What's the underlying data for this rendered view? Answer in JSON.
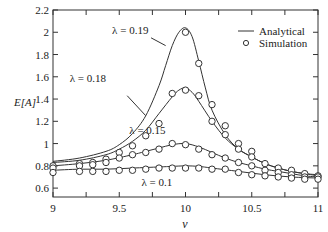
{
  "chart_data": {
    "type": "line",
    "title": "",
    "xlabel": "v",
    "ylabel": "E[A]",
    "xlim": [
      9,
      11
    ],
    "ylim": [
      0.52,
      2.2
    ],
    "xticks": [
      9,
      9.5,
      10,
      10.5,
      11
    ],
    "xtick_labels": [
      "9",
      "9.5",
      "10",
      "10.5",
      "11"
    ],
    "yticks": [
      0.6,
      0.8,
      1,
      1.2,
      1.4,
      1.6,
      1.8,
      2,
      2.2
    ],
    "ytick_labels": [
      "0.6",
      "0.8",
      "1",
      "1.2",
      "1.4",
      "1.6",
      "1.8",
      "2",
      "2.2"
    ],
    "grid": false,
    "legend": {
      "position": "upper right",
      "entries": [
        {
          "label": "Analytical",
          "marker": "line"
        },
        {
          "label": "Simulation",
          "marker": "circle"
        }
      ]
    },
    "series": [
      {
        "name": "λ = 0.19",
        "label_pos": [
          9.72,
          1.98
        ],
        "analytical": {
          "x": [
            9,
            9.2,
            9.4,
            9.5,
            9.6,
            9.7,
            9.8,
            9.85,
            9.9,
            9.95,
            10,
            10.05,
            10.1,
            10.15,
            10.2,
            10.3,
            10.4,
            10.5,
            10.6,
            10.7,
            10.8,
            10.9,
            11
          ],
          "y": [
            0.84,
            0.87,
            0.93,
            0.99,
            1.09,
            1.25,
            1.52,
            1.7,
            1.88,
            2.0,
            2.04,
            1.96,
            1.74,
            1.5,
            1.3,
            1.08,
            0.95,
            0.88,
            0.82,
            0.78,
            0.75,
            0.73,
            0.72
          ]
        },
        "simulation": {
          "x": [
            10.0,
            10.1,
            10.2,
            10.3,
            10.4,
            10.5
          ],
          "y": [
            2.0,
            1.72,
            1.35,
            1.16,
            1.0,
            0.93
          ]
        }
      },
      {
        "name": "λ = 0.18",
        "label_pos": [
          9.4,
          1.55
        ],
        "analytical": {
          "x": [
            9,
            9.2,
            9.4,
            9.5,
            9.6,
            9.7,
            9.8,
            9.9,
            9.95,
            10,
            10.05,
            10.1,
            10.2,
            10.3,
            10.4,
            10.5,
            10.6,
            10.7,
            10.8,
            10.9,
            11
          ],
          "y": [
            0.83,
            0.85,
            0.9,
            0.95,
            1.02,
            1.12,
            1.27,
            1.42,
            1.48,
            1.5,
            1.46,
            1.38,
            1.2,
            1.05,
            0.95,
            0.88,
            0.82,
            0.78,
            0.75,
            0.73,
            0.71
          ]
        },
        "simulation": {
          "x": [
            9.0,
            9.2,
            9.3,
            9.4,
            9.5,
            9.6,
            9.7,
            9.8,
            9.9,
            10.0,
            10.1,
            10.2,
            10.3,
            10.4,
            10.5,
            10.6,
            10.7,
            10.8,
            10.9,
            11.0
          ],
          "y": [
            0.8,
            0.82,
            0.83,
            0.86,
            0.92,
            0.98,
            1.07,
            1.18,
            1.45,
            1.48,
            1.43,
            1.2,
            1.08,
            0.95,
            0.88,
            0.82,
            0.78,
            0.76,
            0.73,
            0.71
          ]
        }
      },
      {
        "name": "λ = 0.15",
        "label_pos": [
          9.85,
          1.09
        ],
        "analytical": {
          "x": [
            9,
            9.2,
            9.4,
            9.6,
            9.7,
            9.8,
            9.9,
            10,
            10.1,
            10.2,
            10.3,
            10.4,
            10.5,
            10.6,
            10.7,
            10.8,
            10.9,
            11
          ],
          "y": [
            0.8,
            0.82,
            0.85,
            0.9,
            0.93,
            0.96,
            0.99,
            1.0,
            0.97,
            0.92,
            0.87,
            0.83,
            0.8,
            0.77,
            0.75,
            0.73,
            0.71,
            0.7
          ]
        },
        "simulation": {
          "x": [
            9.0,
            9.2,
            9.3,
            9.4,
            9.5,
            9.6,
            9.7,
            9.8,
            9.9,
            10.0,
            10.1,
            10.2,
            10.3,
            10.4,
            10.5,
            10.6,
            10.7,
            10.8,
            10.9,
            11.0
          ],
          "y": [
            0.78,
            0.8,
            0.81,
            0.83,
            0.87,
            0.9,
            0.92,
            0.95,
            1.0,
            0.99,
            0.95,
            0.9,
            0.87,
            0.83,
            0.8,
            0.76,
            0.74,
            0.72,
            0.7,
            0.7
          ]
        }
      },
      {
        "name": "λ = 0.1",
        "label_pos": [
          9.9,
          0.62
        ],
        "analytical": {
          "x": [
            9,
            9.2,
            9.4,
            9.6,
            9.8,
            9.9,
            10,
            10.1,
            10.2,
            10.4,
            10.6,
            10.8,
            11
          ],
          "y": [
            0.76,
            0.77,
            0.77,
            0.78,
            0.79,
            0.795,
            0.8,
            0.795,
            0.78,
            0.75,
            0.72,
            0.7,
            0.69
          ]
        },
        "simulation": {
          "x": [
            9.0,
            9.2,
            9.3,
            9.4,
            9.5,
            9.6,
            9.7,
            9.8,
            9.9,
            10.0,
            10.1,
            10.2,
            10.3,
            10.4,
            10.5,
            10.6,
            10.7,
            10.8,
            10.9,
            11.0
          ],
          "y": [
            0.74,
            0.75,
            0.75,
            0.75,
            0.76,
            0.76,
            0.77,
            0.78,
            0.78,
            0.78,
            0.78,
            0.77,
            0.77,
            0.74,
            0.72,
            0.71,
            0.7,
            0.69,
            0.68,
            0.68
          ]
        }
      }
    ]
  }
}
